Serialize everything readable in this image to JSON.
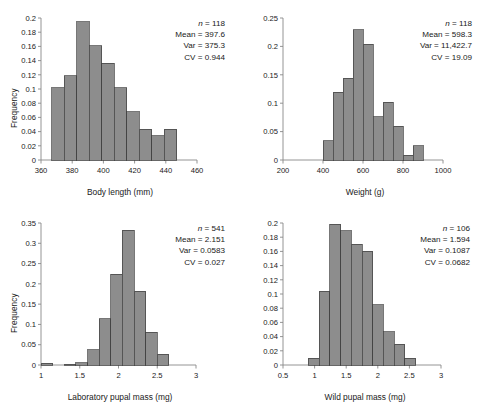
{
  "figure": {
    "panel_count": 4,
    "bar_fill": "#8d8d8d",
    "bar_stroke": "#3d3d3d",
    "axis_color": "#888888",
    "text_color": "#1a1a1a"
  },
  "chart_data": [
    {
      "id": "body-length",
      "type": "bar",
      "title": "",
      "xlabel": "Body length (mm)",
      "ylabel": "Frequency",
      "xlim": [
        360,
        460
      ],
      "ylim": [
        0,
        0.2
      ],
      "xticks": [
        360,
        380,
        400,
        420,
        440,
        460
      ],
      "xtick_labels": [
        "360",
        "380",
        "400",
        "420",
        "440",
        "460"
      ],
      "yticks": [
        0,
        0.02,
        0.04,
        0.06,
        0.08,
        0.1,
        0.12,
        0.14,
        0.16,
        0.18,
        0.2
      ],
      "ytick_labels": [
        "0",
        "0.02",
        "0.04",
        "0.06",
        "0.08",
        "0.1",
        "0.12",
        "0.14",
        "0.16",
        "0.18",
        "0.2"
      ],
      "grid": false,
      "bin_edges": [
        367,
        375,
        383,
        391,
        399,
        407,
        415,
        423,
        431,
        439,
        447
      ],
      "values": [
        0.102,
        0.119,
        0.195,
        0.161,
        0.136,
        0.102,
        0.068,
        0.043,
        0.034,
        0.043
      ],
      "annotations": {
        "n_label": "n",
        "n_value": "= 118",
        "mean": "Mean = 397.6",
        "var": "Var = 375.3",
        "cv": "CV = 0.944"
      }
    },
    {
      "id": "weight",
      "type": "bar",
      "title": "",
      "xlabel": "Weight (g)",
      "ylabel": "",
      "xlim": [
        200,
        1000
      ],
      "ylim": [
        0,
        0.25
      ],
      "xticks": [
        200,
        400,
        600,
        800,
        1000
      ],
      "xtick_labels": [
        "200",
        "400",
        "600",
        "800",
        "1000"
      ],
      "yticks": [
        0,
        0.05,
        0.1,
        0.15,
        0.2,
        0.25
      ],
      "ytick_labels": [
        "0",
        "0.05",
        "0.1",
        "0.15",
        "0.2",
        "0.25"
      ],
      "grid": false,
      "bin_edges": [
        400,
        450,
        500,
        550,
        600,
        650,
        700,
        750,
        800,
        850,
        900
      ],
      "values": [
        0.034,
        0.119,
        0.144,
        0.229,
        0.204,
        0.076,
        0.102,
        0.059,
        0.008,
        0.025
      ],
      "annotations": {
        "n_label": "n",
        "n_value": "= 118",
        "mean": "Mean = 598.3",
        "var": "Var = 11,422.7",
        "cv": "CV = 19.09"
      }
    },
    {
      "id": "laboratory-pupal-mass",
      "type": "bar",
      "title": "",
      "xlabel": "Laboratory pupal mass (mg)",
      "ylabel": "Frequency",
      "xlim": [
        1,
        3
      ],
      "ylim": [
        0,
        0.35
      ],
      "xticks": [
        1,
        1.5,
        2,
        2.5,
        3
      ],
      "xtick_labels": [
        "1",
        "1.5",
        "2",
        "2.5",
        "3"
      ],
      "yticks": [
        0,
        0.05,
        0.1,
        0.15,
        0.2,
        0.25,
        0.3,
        0.35
      ],
      "ytick_labels": [
        "0",
        "0.05",
        "0.1",
        "0.15",
        "0.2",
        "0.25",
        "0.3",
        "0.35"
      ],
      "grid": false,
      "bin_edges": [
        1.0,
        1.15,
        1.3,
        1.45,
        1.6,
        1.75,
        1.9,
        2.05,
        2.2,
        2.35,
        2.5,
        2.65,
        2.8
      ],
      "values": [
        0.004,
        0.0,
        0.002,
        0.006,
        0.037,
        0.114,
        0.224,
        0.332,
        0.182,
        0.081,
        0.026
      ],
      "annotations": {
        "n_label": "n",
        "n_value": "= 541",
        "mean": "Mean = 2.151",
        "var": "Var = 0.0583",
        "cv": "CV = 0.027"
      }
    },
    {
      "id": "wild-pupal-mass",
      "type": "bar",
      "title": "",
      "xlabel": "Wild pupal mass (mg)",
      "ylabel": "",
      "xlim": [
        0.5,
        3
      ],
      "ylim": [
        0,
        0.2
      ],
      "xticks": [
        0.5,
        1,
        1.5,
        2,
        2.5,
        3
      ],
      "xtick_labels": [
        "0.5",
        "1",
        "1.5",
        "2",
        "2.5",
        "3"
      ],
      "yticks": [
        0,
        0.02,
        0.04,
        0.06,
        0.08,
        0.1,
        0.12,
        0.14,
        0.16,
        0.18,
        0.2
      ],
      "ytick_labels": [
        "0",
        "0.02",
        "0.04",
        "0.06",
        "0.08",
        "0.1",
        "0.12",
        "0.14",
        "0.16",
        "0.18",
        "0.2"
      ],
      "grid": false,
      "bin_edges": [
        0.9,
        1.07,
        1.24,
        1.41,
        1.58,
        1.75,
        1.92,
        2.09,
        2.26,
        2.43,
        2.6
      ],
      "values": [
        0.0095,
        0.104,
        0.198,
        0.189,
        0.17,
        0.16,
        0.085,
        0.047,
        0.029,
        0.0095
      ],
      "annotations": {
        "n_label": "n",
        "n_value": "= 106",
        "mean": "Mean = 1.594",
        "var": "Var = 0.1087",
        "cv": "CV = 0.0682"
      }
    }
  ]
}
